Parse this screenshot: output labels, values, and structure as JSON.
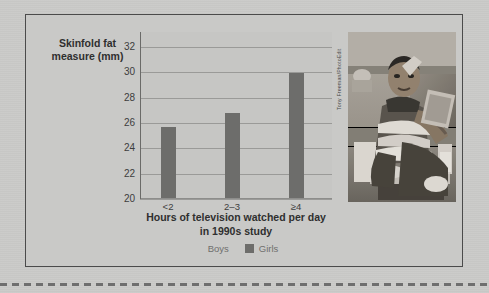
{
  "figure": {
    "y_axis_title": "Skinfold fat measure (mm)",
    "x_axis_title_line1": "Hours of television watched per day",
    "x_axis_title_line2": "in 1990s study",
    "photo_credit": "Tony Freeman/PhotoEdit",
    "colors": {
      "background": "#c9c9c7",
      "frame_border": "#4b4b4b",
      "bar": "#6d6d6b",
      "gridline": "#9a9a98",
      "text": "#3a3a3a",
      "legend_text": "#6f6f6d"
    }
  },
  "legend": {
    "items": [
      {
        "label": "Boys",
        "swatch": "#c9c9c7"
      },
      {
        "label": "Girls",
        "swatch": "#6d6d6b"
      }
    ]
  },
  "chart_data": {
    "type": "bar",
    "title": "",
    "categories": [
      "<2",
      "2–3",
      "≥4"
    ],
    "values": [
      25.7,
      26.8,
      30.0
    ],
    "series": [
      {
        "name": "Girls",
        "values": [
          25.7,
          26.8,
          30.0
        ]
      }
    ],
    "xlabel": "Hours of television watched per day in 1990s study",
    "ylabel": "Skinfold fat measure (mm)",
    "ylim": [
      20,
      33.2
    ],
    "yticks": [
      20,
      22,
      24,
      26,
      28,
      30,
      32
    ],
    "ytick_labels": [
      "20",
      "22",
      "24",
      "26",
      "28",
      "30",
      "32"
    ],
    "grid": true,
    "legend_position": "bottom"
  }
}
